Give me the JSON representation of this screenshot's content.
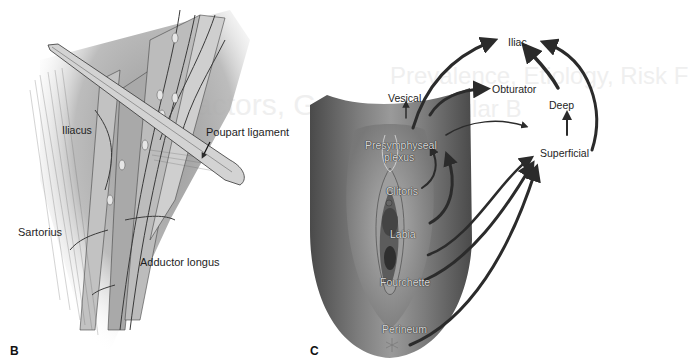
{
  "figure": {
    "panel_b": {
      "letter": "B",
      "labels": {
        "iliacus": "Iliacus",
        "poupart_ligament": "Poupart ligament",
        "sartorius": "Sartorius",
        "adductor_longus": "Adductor longus"
      }
    },
    "panel_c": {
      "letter": "C",
      "anatomy_labels": {
        "presymphyseal_line1": "Presymphyseal",
        "presymphyseal_line2": "plexus",
        "clitoris": "Clitoris",
        "labia": "Labia",
        "fourchette": "Fourchette",
        "perineum": "Perineum"
      },
      "node_labels": {
        "vesical": "Vesical",
        "obturator": "Obturator",
        "iliac": "Iliac",
        "deep": "Deep",
        "superficial": "Superficial"
      }
    }
  },
  "background_bleed": {
    "title_fragment_1": "actors, Ge",
    "title_fragment_2": "Prevalence, Etiology, Risk F",
    "title_fragment_3": "aceular B"
  },
  "colors": {
    "arrow": "#2b2b2b",
    "skin_dark": "#5a5a5a",
    "skin_mid": "#8a8a8a",
    "muscle": "#bdbdbd",
    "ligament": "#cfcfcf"
  }
}
